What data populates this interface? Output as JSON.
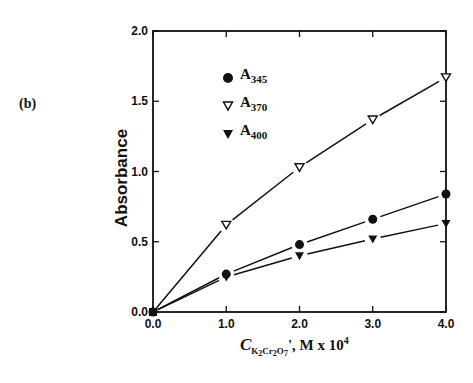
{
  "panel_label": "(b)",
  "chart_data": {
    "type": "line",
    "title": "",
    "panel": "(b)",
    "xlabel": "C_{K2Cr2O7}, M x 10^4",
    "ylabel": "Absorbance",
    "xlim": [
      0.0,
      4.0
    ],
    "ylim": [
      0.0,
      2.0
    ],
    "x_ticks": [
      "0.0",
      "1.0",
      "2.0",
      "3.0",
      "4.0"
    ],
    "y_ticks": [
      "0.0",
      "0.5",
      "1.0",
      "1.5",
      "2.0"
    ],
    "grid": false,
    "legend_position": "upper left inside",
    "x": [
      0.0,
      1.0,
      2.0,
      3.0,
      4.0
    ],
    "series": [
      {
        "name": "A345",
        "marker": "filled-circle",
        "values": [
          0.0,
          0.27,
          0.48,
          0.66,
          0.84
        ]
      },
      {
        "name": "A370",
        "marker": "open-down-triangle",
        "values": [
          0.0,
          0.62,
          1.03,
          1.37,
          1.67
        ]
      },
      {
        "name": "A400",
        "marker": "filled-down-triangle",
        "values": [
          0.0,
          0.25,
          0.4,
          0.52,
          0.63
        ]
      }
    ]
  },
  "axes": {
    "ylabel": "Absorbance",
    "xlabel": {
      "symbol": "C",
      "subscript_k": "K",
      "subscript_k_n": "2",
      "subscript_cr": "Cr",
      "subscript_cr_n": "2",
      "subscript_o": "O",
      "subscript_o_n": "7",
      "suffix": "', M x 10",
      "exponent": "4"
    }
  },
  "legend": [
    {
      "base": "A",
      "sub": "345"
    },
    {
      "base": "A",
      "sub": "370"
    },
    {
      "base": "A",
      "sub": "400"
    }
  ],
  "colors": {
    "ink": "#111111",
    "background": "#ffffff"
  }
}
